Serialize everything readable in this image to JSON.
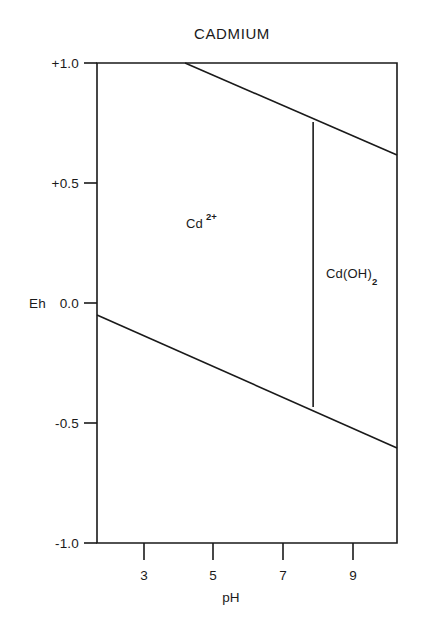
{
  "chart_data": {
    "type": "line",
    "title": "CADMIUM",
    "subtitle": "",
    "xlabel": "pH",
    "ylabel": "Eh",
    "xlim": [
      1.65,
      10.27
    ],
    "ylim": [
      -1.0,
      1.0
    ],
    "grid": false,
    "legend_position": "none",
    "xticks": [
      {
        "label": "3",
        "value": 3
      },
      {
        "label": "5",
        "value": 5
      },
      {
        "label": "7",
        "value": 7
      },
      {
        "label": "9",
        "value": 9
      }
    ],
    "yticks": [
      {
        "label": "+1.0",
        "value": 1.0
      },
      {
        "label": "+0.5",
        "value": 0.5
      },
      {
        "label": "0.0",
        "value": 0.0
      },
      {
        "label": "-0.5",
        "value": -0.5
      },
      {
        "label": "-1.0",
        "value": -1.0
      }
    ],
    "series": [
      {
        "name": "water-upper-stability-line",
        "points": [
          {
            "pH": 4.18,
            "Eh": 1.0
          },
          {
            "pH": 10.27,
            "Eh": 0.617
          }
        ]
      },
      {
        "name": "water-lower-stability-line",
        "points": [
          {
            "pH": 1.65,
            "Eh": -0.05
          },
          {
            "pH": 10.27,
            "Eh": -0.604
          }
        ]
      },
      {
        "name": "cd2-cdoh2-boundary",
        "points": [
          {
            "pH": 7.86,
            "Eh": 0.754
          },
          {
            "pH": 7.86,
            "Eh": -0.433
          }
        ]
      }
    ],
    "annotations": [
      {
        "name": "cd2plus-field-label",
        "base": "Cd",
        "superscript": "2+",
        "subscript": "",
        "pH": 4.22,
        "Eh": 0.306
      },
      {
        "name": "cdoh2-field-label",
        "base": "Cd(OH)",
        "superscript": "",
        "subscript": "2",
        "pH": 9.09,
        "Eh": 0.092
      }
    ]
  },
  "chart": {
    "title": "CADMIUM",
    "y_axis_name": "Eh",
    "x_axis_name": "pH",
    "y_tick_labels": [
      "+1.0",
      "+0.5",
      "0.0",
      "-0.5",
      "-1.0"
    ],
    "x_tick_labels": [
      "3",
      "5",
      "7",
      "9"
    ],
    "species": {
      "cd2plus": {
        "base": "Cd",
        "superscript": "2+"
      },
      "cdoh2": {
        "base": "Cd(OH)",
        "subscript": "2"
      }
    },
    "colors": {
      "line": "#1a1a1a",
      "text": "#1a1a1a",
      "background": "#ffffff"
    }
  }
}
